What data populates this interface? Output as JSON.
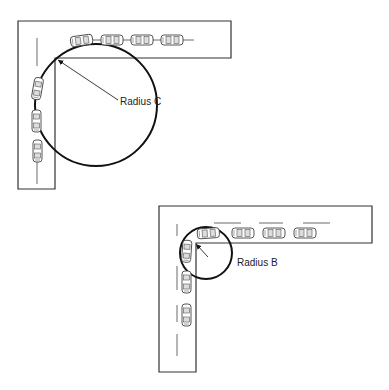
{
  "figure": {
    "colors": {
      "line": "#333333",
      "circle": "#111111",
      "background": "#ffffff"
    }
  },
  "diagrams": [
    {
      "id": "large-radius",
      "label": "Radius C",
      "label_pos": {
        "x": 120,
        "y": 96
      },
      "circle": {
        "cx": 96,
        "cy": 105,
        "r": 61
      },
      "arrow": {
        "x1": 118,
        "y1": 100,
        "x2": 57,
        "y2": 59
      }
    },
    {
      "id": "small-radius",
      "label": "Radius B",
      "label_pos": {
        "x": 237,
        "y": 257
      },
      "circle": {
        "cx": 206,
        "cy": 253,
        "r": 26
      },
      "arrow": {
        "x1": 208,
        "y1": 257,
        "x2": 195,
        "y2": 243
      }
    }
  ]
}
